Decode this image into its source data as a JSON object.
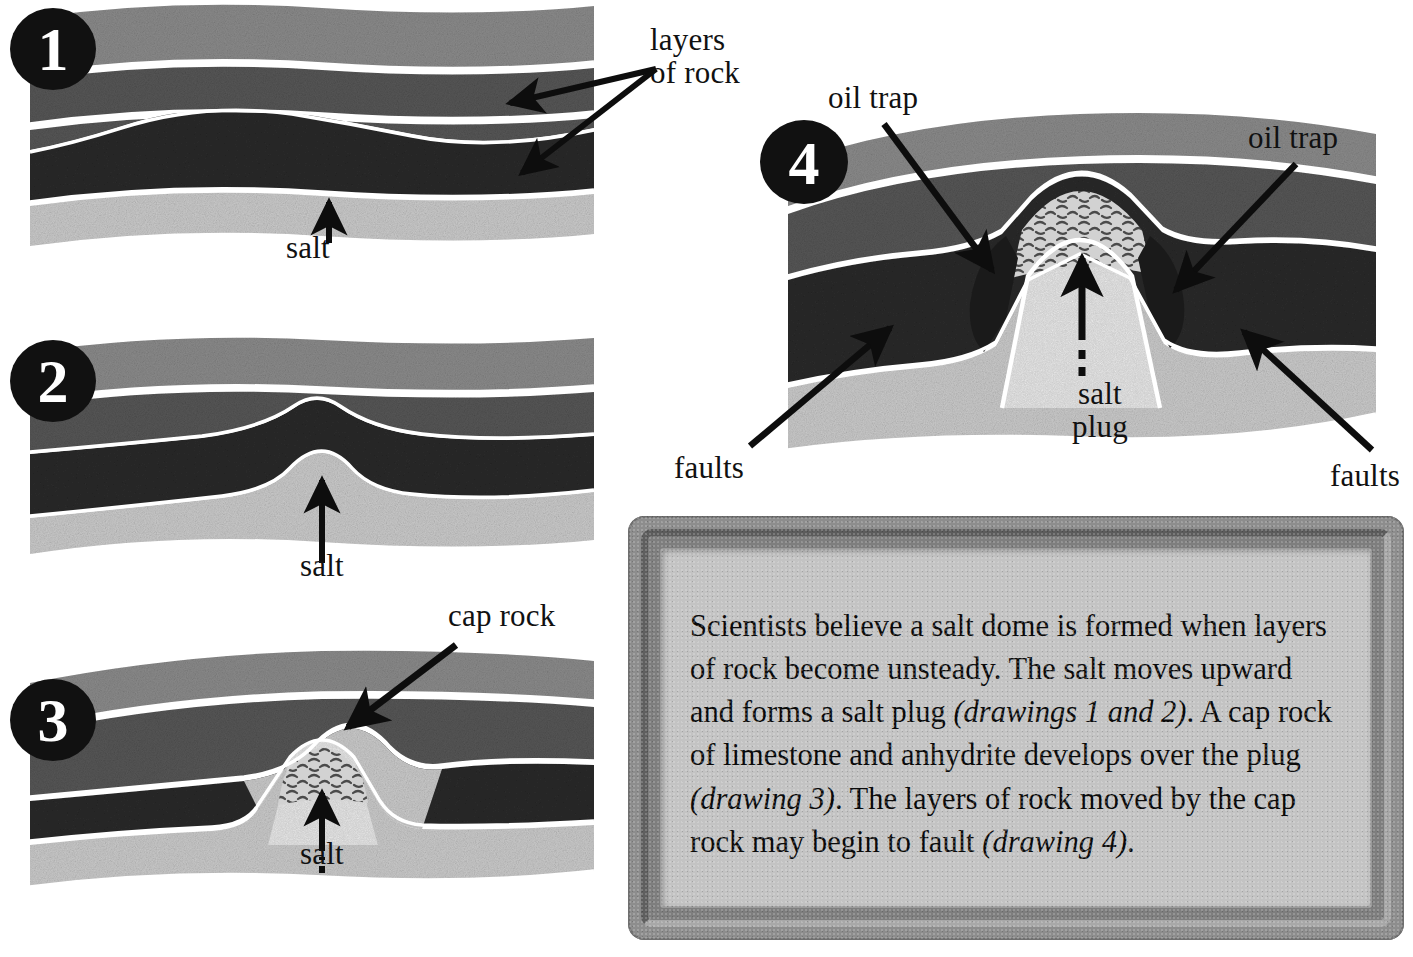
{
  "figure": {
    "palette": {
      "layer_top": "#8a8a8a",
      "layer_second": "#565656",
      "layer_third": "#2a2a2a",
      "salt": "#c9c9c9",
      "cap_rock": "#cfcfcf",
      "outline": "#ffffff",
      "ink": "#111111",
      "frame_outer": "#8d8d8d",
      "frame_inner_panel": "#c3c3c3"
    }
  },
  "stages": [
    {
      "number": "1",
      "name": "undisturbed-layers",
      "labels": {
        "layers_of_rock": "layers\nof rock",
        "salt": "salt"
      }
    },
    {
      "number": "2",
      "name": "salt-begins-to-rise",
      "labels": {
        "salt": "salt"
      }
    },
    {
      "number": "3",
      "name": "cap-rock-develops",
      "labels": {
        "cap_rock": "cap rock",
        "salt": "salt"
      }
    },
    {
      "number": "4",
      "name": "faulting-and-oil-traps",
      "labels": {
        "oil_trap_left": "oil trap",
        "oil_trap_right": "oil trap",
        "salt_plug": "salt\nplug",
        "faults_left": "faults",
        "faults_right": "faults"
      }
    }
  ],
  "caption": {
    "segments": [
      {
        "text": "Scientists believe a salt dome is formed when layers of rock become unsteady. The salt moves upward and forms a salt plug ",
        "style": "normal"
      },
      {
        "text": "(drawings 1 and 2)",
        "style": "italic"
      },
      {
        "text": ". A cap rock of limestone and anhydrite develops over the plug ",
        "style": "normal"
      },
      {
        "text": "(drawing 3)",
        "style": "italic"
      },
      {
        "text": ". The layers of rock moved by the cap rock may begin to fault ",
        "style": "normal"
      },
      {
        "text": "(drawing 4)",
        "style": "italic"
      },
      {
        "text": ".",
        "style": "normal"
      }
    ],
    "plain_text": "Scientists believe a salt dome is formed when layers of rock become unsteady. The salt moves upward and forms a salt plug (drawings 1 and 2). A cap rock of limestone and anhydrite develops over the plug (drawing 3). The layers of rock moved by the cap rock may begin to fault (drawing 4)."
  }
}
